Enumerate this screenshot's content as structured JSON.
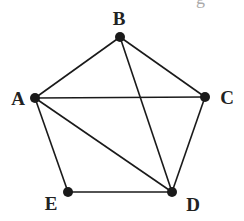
{
  "diagram": {
    "type": "graph",
    "title_fragment": "g",
    "nodes": [
      {
        "id": "A",
        "label": "A",
        "x": 35,
        "y": 98,
        "label_x": 18,
        "label_y": 105
      },
      {
        "id": "B",
        "label": "B",
        "x": 120,
        "y": 37,
        "label_x": 119,
        "label_y": 25
      },
      {
        "id": "C",
        "label": "C",
        "x": 205,
        "y": 97,
        "label_x": 227,
        "label_y": 104
      },
      {
        "id": "D",
        "label": "D",
        "x": 172,
        "y": 192,
        "label_x": 193,
        "label_y": 211
      },
      {
        "id": "E",
        "label": "E",
        "x": 68,
        "y": 192,
        "label_x": 51,
        "label_y": 210
      }
    ],
    "edges": [
      [
        "A",
        "B"
      ],
      [
        "B",
        "C"
      ],
      [
        "A",
        "C"
      ],
      [
        "B",
        "D"
      ],
      [
        "A",
        "D"
      ],
      [
        "A",
        "E"
      ],
      [
        "C",
        "D"
      ],
      [
        "E",
        "D"
      ]
    ],
    "colors": {
      "stroke": "#1a1a1a",
      "node": "#1a1a1a",
      "label": "#222222"
    }
  }
}
